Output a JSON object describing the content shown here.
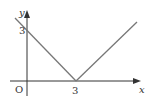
{
  "diagram": {
    "axes": {
      "x_label": "x",
      "y_label": "y",
      "origin_label": "O"
    },
    "tick_labels": {
      "x_vertex": "3",
      "y_intercept": "3"
    },
    "function": "y = |x - 3|",
    "key_points": [
      {
        "name": "y-intercept",
        "x": 0,
        "y": 3
      },
      {
        "name": "vertex",
        "x": 3,
        "y": 0
      }
    ],
    "colors": {
      "axis": "#333333",
      "graph_line": "#777777"
    }
  }
}
